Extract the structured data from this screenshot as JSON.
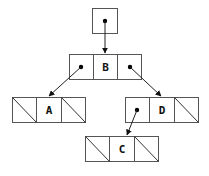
{
  "diagram": {
    "title": "",
    "root_pointer": {
      "label": "root"
    },
    "nodes": [
      {
        "id": "B",
        "label": "B",
        "left": "pointer",
        "right": "pointer"
      },
      {
        "id": "A",
        "label": "A",
        "left": "null",
        "right": "null"
      },
      {
        "id": "D",
        "label": "D",
        "left": "pointer",
        "right": "null"
      },
      {
        "id": "C",
        "label": "C",
        "left": "null",
        "right": "null"
      }
    ],
    "edges": [
      {
        "from": "root",
        "to": "B"
      },
      {
        "from": "B.left",
        "to": "A"
      },
      {
        "from": "B.right",
        "to": "D"
      },
      {
        "from": "D.left",
        "to": "C"
      }
    ],
    "colors": {
      "line": "#555555",
      "text": "#111111",
      "background": "#ffffff"
    }
  }
}
